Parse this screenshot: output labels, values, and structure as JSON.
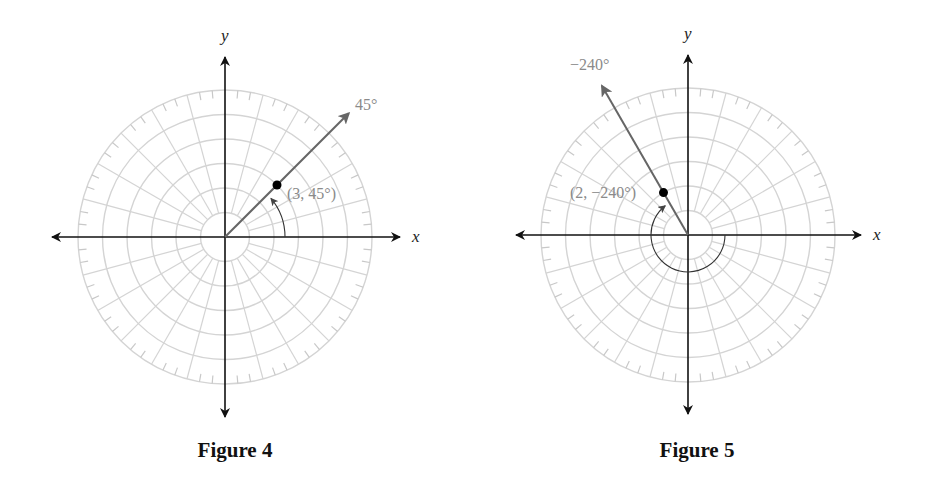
{
  "figures": [
    {
      "id": "figure-4",
      "caption": "Figure 4",
      "center": [
        225,
        237
      ],
      "unit_px": 24.5,
      "rings": 6,
      "spoke_step_deg": 15,
      "tick_step_deg": 5,
      "axis_extent": {
        "left": 52,
        "right": 400,
        "top": 57,
        "bottom": 417
      },
      "x_label": "x",
      "y_label": "y",
      "ray": {
        "angle_deg": 45,
        "length_px": 175,
        "label": "45°",
        "label_pos": [
          355,
          110
        ]
      },
      "point": {
        "r": 3,
        "theta_deg": 45,
        "label": "(3, 45°)",
        "label_pos": [
          287,
          199
        ]
      },
      "arc": {
        "radius_px": 60,
        "start_deg": 0,
        "end_deg": 40,
        "direction": "counterclockwise"
      },
      "caption_pos": [
        235,
        458
      ]
    },
    {
      "id": "figure-5",
      "caption": "Figure 5",
      "center": [
        688,
        235
      ],
      "unit_px": 24.5,
      "rings": 6,
      "spoke_step_deg": 15,
      "tick_step_deg": 5,
      "axis_extent": {
        "left": 516,
        "right": 861,
        "top": 55,
        "bottom": 414
      },
      "x_label": "x",
      "y_label": "y",
      "ray": {
        "angle_deg": 120,
        "length_px": 172,
        "label": "−240°",
        "label_pos": [
          570,
          70
        ]
      },
      "point": {
        "r": 2,
        "theta_deg": -240,
        "label": "(2, −240°)",
        "label_pos": [
          570,
          198
        ]
      },
      "arc": {
        "radius_px": 37,
        "start_deg": 0,
        "end_deg": -232,
        "direction": "clockwise"
      },
      "caption_pos": [
        697,
        458
      ]
    }
  ],
  "chart_data": [
    {
      "type": "polar-diagram",
      "title": "Figure 4",
      "grid": {
        "rings": 6,
        "spokes_every_deg": 15,
        "ticks_every_deg": 5
      },
      "axes": {
        "x_label": "x",
        "y_label": "y"
      },
      "ray": {
        "angle": "45°"
      },
      "points": [
        {
          "r": 3,
          "theta_deg": 45,
          "label": "(3, 45°)"
        }
      ],
      "arc": {
        "from_deg": 0,
        "to_deg": 45,
        "direction": "counterclockwise"
      }
    },
    {
      "type": "polar-diagram",
      "title": "Figure 5",
      "grid": {
        "rings": 6,
        "spokes_every_deg": 15,
        "ticks_every_deg": 5
      },
      "axes": {
        "x_label": "x",
        "y_label": "y"
      },
      "ray": {
        "angle": "−240°"
      },
      "points": [
        {
          "r": 2,
          "theta_deg": -240,
          "label": "(2, −240°)"
        }
      ],
      "arc": {
        "from_deg": 0,
        "to_deg": -240,
        "direction": "clockwise"
      }
    }
  ]
}
